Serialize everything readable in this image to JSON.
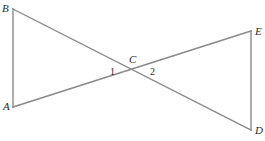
{
  "figure": {
    "background_color": "#ffffff",
    "stroke_color": "#8a8a8a",
    "stroke_width": 1.4,
    "label_color": "#2b2b2b",
    "width": 265,
    "height": 141,
    "points": {
      "A": {
        "label": "A",
        "x": 13,
        "y": 107
      },
      "B": {
        "label": "B",
        "x": 13,
        "y": 9
      },
      "C": {
        "label": "C",
        "x": 133,
        "y": 70
      },
      "D": {
        "label": "D",
        "x": 251,
        "y": 130
      },
      "E": {
        "label": "E",
        "x": 251,
        "y": 31
      }
    },
    "angles": [
      {
        "label": "1",
        "at": "C",
        "side": "left"
      },
      {
        "label": "2",
        "at": "C",
        "side": "right"
      }
    ],
    "segments": [
      {
        "name": "AB",
        "from": "A",
        "to": "B"
      },
      {
        "name": "BD",
        "from": "B",
        "to": "D"
      },
      {
        "name": "AE",
        "from": "A",
        "to": "E"
      },
      {
        "name": "ED",
        "from": "E",
        "to": "D"
      }
    ]
  }
}
